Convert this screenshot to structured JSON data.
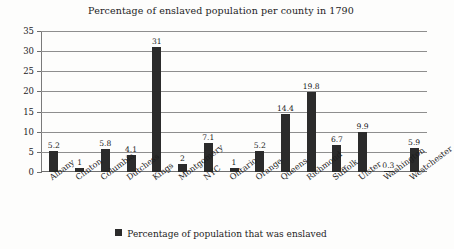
{
  "chart_data": {
    "type": "bar",
    "title": "Percentage of enslaved population per county in 1790",
    "xlabel": "",
    "ylabel": "",
    "ylim": [
      0,
      35
    ],
    "yticks": [
      0,
      5,
      10,
      15,
      20,
      25,
      30,
      35
    ],
    "grid": true,
    "legend_position": "bottom",
    "series": [
      {
        "name": "Percentage of population that was enslaved",
        "color": "#2b2b2b",
        "values": [
          5.2,
          1,
          5.8,
          4.1,
          31,
          2,
          7.1,
          1,
          5.2,
          14.4,
          19.8,
          6.7,
          9.9,
          0.3,
          5.9
        ]
      }
    ],
    "categories": [
      "Albany",
      "Clinton",
      "Columbia",
      "Dutchess",
      "Kings",
      "Montgomery",
      "NYC",
      "Ontario",
      "Orange",
      "Queens",
      "Richmond",
      "Suffolk",
      "Ulster",
      "Washington",
      "Westchester"
    ],
    "value_labels": [
      "5.2",
      "1",
      "5.8",
      "4.1",
      "31",
      "2",
      "7.1",
      "1",
      "5.2",
      "14.4",
      "19.8",
      "6.7",
      "9.9",
      "0.3",
      "5.9"
    ],
    "ytick_labels": [
      "0",
      "5",
      "10",
      "15",
      "20",
      "25",
      "30",
      "35"
    ]
  },
  "legend": {
    "entries": [
      {
        "label": "Percentage of population that was enslaved",
        "color": "#2b2b2b",
        "marker": "square"
      }
    ]
  },
  "colors": {
    "bar": "#2b2b2b",
    "gridline": "#8e8e8e",
    "axis": "#6e6e6e",
    "background": "#fdfdfc",
    "text": "#1c1c1c"
  }
}
